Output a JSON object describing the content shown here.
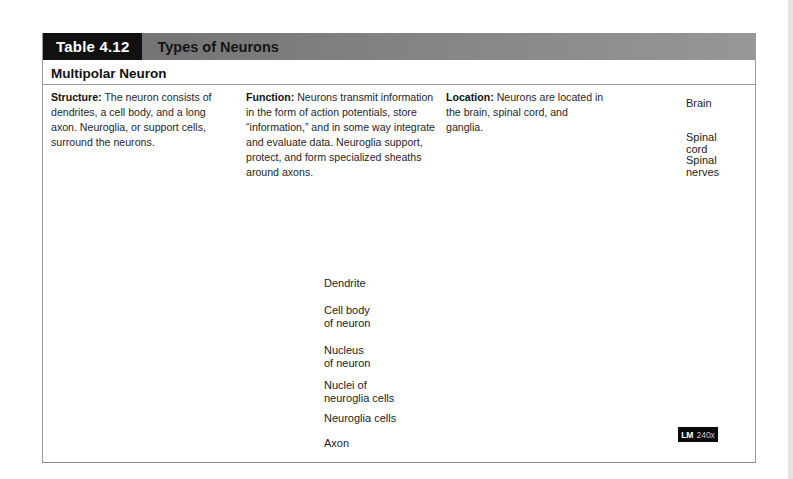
{
  "header": {
    "table_label": "Table 4.12",
    "title": "Types of Neurons"
  },
  "section": {
    "title": "Multipolar Neuron"
  },
  "columns": {
    "structure": {
      "label": "Structure:",
      "text": "The neuron consists of dendrites, a cell body, and a long axon. Neuroglia, or support cells, surround the neurons."
    },
    "function": {
      "label": "Function:",
      "text": "Neurons transmit information in the form of action potentials, store “information,” and in some way integrate and evaluate data. Neuroglia support, protect, and form specialized sheaths around axons."
    },
    "location": {
      "label": "Location:",
      "text": "Neurons are located in the brain, spinal cord, and ganglia."
    }
  },
  "body_figure": {
    "labels": [
      {
        "text": "Brain"
      },
      {
        "text": "Spinal\ncord"
      },
      {
        "text": "Spinal\nnerves"
      }
    ]
  },
  "neuron_figure": {
    "labels": [
      {
        "text": "Dendrite"
      },
      {
        "text": "Cell body\nof neuron"
      },
      {
        "text": "Nucleus\nof neuron"
      },
      {
        "text": "Nuclei of\nneuroglia cells"
      },
      {
        "text": "Neuroglia cells"
      },
      {
        "text": "Axon"
      }
    ]
  },
  "micrograph": {
    "label_bold": "LM",
    "label_value": "240x"
  },
  "colors": {
    "header_box": "#111111",
    "header_bar": "#7d7d7d",
    "body_text": "#262626",
    "leader_line": "#3c3c3a",
    "badge_bg": "#0a0a0a"
  }
}
